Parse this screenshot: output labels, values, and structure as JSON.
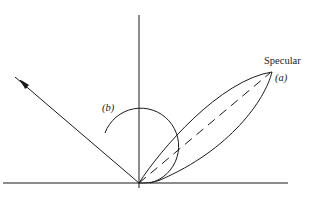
{
  "diagram": {
    "type": "reflection-lobe-diagram",
    "labels": {
      "specular": "Specular",
      "a": "(a)",
      "b": "(b)"
    },
    "elements": {
      "surface": "horizontal surface line",
      "normal": "vertical surface normal",
      "incident_ray": "incident ray with arrow",
      "specular_lobe": "elongated specular reflection lobe (a)",
      "specular_direction": "dashed specular direction line",
      "diffuse_lobe": "circular diffuse reflection lobe (b)"
    },
    "colors": {
      "line": "#1a1a1a",
      "background": "#ffffff"
    }
  }
}
